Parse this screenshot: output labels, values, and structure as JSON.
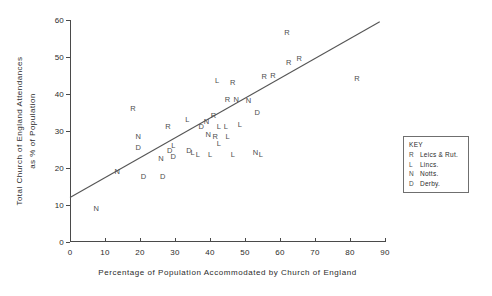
{
  "chart_data": {
    "type": "scatter",
    "title": "",
    "xlabel": "Percentage of Population Accommodated by Church of England",
    "ylabel_line1": "Total Church of England Attendances",
    "ylabel_line2": "as % of Population",
    "xlim": [
      0,
      90
    ],
    "ylim": [
      0,
      60
    ],
    "xticks": [
      0,
      10,
      20,
      30,
      40,
      50,
      60,
      70,
      80,
      90
    ],
    "yticks": [
      0,
      10,
      20,
      30,
      40,
      50,
      60
    ],
    "grid": false,
    "legend_position": "right-outside",
    "series": [
      {
        "name": "Leics & Rut.",
        "symbol": "R"
      },
      {
        "name": "Lincs.",
        "symbol": "L"
      },
      {
        "name": "Notts.",
        "symbol": "N"
      },
      {
        "name": "Derby.",
        "symbol": "D"
      }
    ],
    "points": [
      {
        "symbol": "N",
        "x": 7.5,
        "y": 9.0
      },
      {
        "symbol": "N",
        "x": 13.5,
        "y": 19.0
      },
      {
        "symbol": "R",
        "x": 18.0,
        "y": 36.0
      },
      {
        "symbol": "N",
        "x": 19.5,
        "y": 28.5
      },
      {
        "symbol": "D",
        "x": 19.5,
        "y": 25.5
      },
      {
        "symbol": "D",
        "x": 21.0,
        "y": 17.5
      },
      {
        "symbol": "N",
        "x": 26.0,
        "y": 22.5
      },
      {
        "symbol": "D",
        "x": 26.5,
        "y": 17.5
      },
      {
        "symbol": "R",
        "x": 28.0,
        "y": 31.0
      },
      {
        "symbol": "D",
        "x": 28.5,
        "y": 24.5
      },
      {
        "symbol": "L",
        "x": 29.5,
        "y": 26.0
      },
      {
        "symbol": "D",
        "x": 29.5,
        "y": 23.0
      },
      {
        "symbol": "L",
        "x": 33.5,
        "y": 33.0
      },
      {
        "symbol": "D",
        "x": 34.0,
        "y": 24.5
      },
      {
        "symbol": "L",
        "x": 35.0,
        "y": 24.0
      },
      {
        "symbol": "L",
        "x": 36.5,
        "y": 23.5
      },
      {
        "symbol": "D",
        "x": 37.5,
        "y": 31.0
      },
      {
        "symbol": "N",
        "x": 39.0,
        "y": 32.5
      },
      {
        "symbol": "N",
        "x": 39.5,
        "y": 29.0
      },
      {
        "symbol": "L",
        "x": 40.0,
        "y": 23.5
      },
      {
        "symbol": "R",
        "x": 41.0,
        "y": 34.0
      },
      {
        "symbol": "R",
        "x": 41.5,
        "y": 28.5
      },
      {
        "symbol": "L",
        "x": 42.0,
        "y": 43.5
      },
      {
        "symbol": "L",
        "x": 42.5,
        "y": 31.0
      },
      {
        "symbol": "L",
        "x": 42.5,
        "y": 26.5
      },
      {
        "symbol": "L",
        "x": 44.5,
        "y": 31.0
      },
      {
        "symbol": "R",
        "x": 45.0,
        "y": 38.5
      },
      {
        "symbol": "L",
        "x": 45.0,
        "y": 28.5
      },
      {
        "symbol": "L",
        "x": 46.5,
        "y": 23.5
      },
      {
        "symbol": "R",
        "x": 46.5,
        "y": 43.0
      },
      {
        "symbol": "N",
        "x": 47.5,
        "y": 38.5
      },
      {
        "symbol": "L",
        "x": 48.5,
        "y": 31.5
      },
      {
        "symbol": "N",
        "x": 51.0,
        "y": 38.0
      },
      {
        "symbol": "N",
        "x": 53.0,
        "y": 24.0
      },
      {
        "symbol": "L",
        "x": 54.5,
        "y": 23.5
      },
      {
        "symbol": "D",
        "x": 53.5,
        "y": 35.0
      },
      {
        "symbol": "R",
        "x": 55.5,
        "y": 44.5
      },
      {
        "symbol": "R",
        "x": 58.0,
        "y": 45.0
      },
      {
        "symbol": "R",
        "x": 62.0,
        "y": 56.5
      },
      {
        "symbol": "R",
        "x": 62.5,
        "y": 48.5
      },
      {
        "symbol": "R",
        "x": 65.5,
        "y": 49.5
      },
      {
        "symbol": "R",
        "x": 82.0,
        "y": 44.0
      }
    ],
    "trend_line": {
      "x0": 0.0,
      "y0": 12.0,
      "x1": 88.5,
      "y1": 59.5
    }
  },
  "legend": {
    "title": "KEY",
    "rows": [
      {
        "symbol": "R",
        "label": "Leics & Rut."
      },
      {
        "symbol": "L",
        "label": "Lincs."
      },
      {
        "symbol": "N",
        "label": "Notts."
      },
      {
        "symbol": "D",
        "label": "Derby."
      }
    ]
  }
}
